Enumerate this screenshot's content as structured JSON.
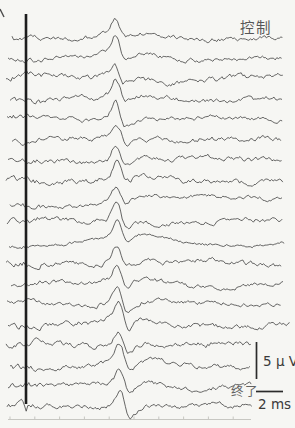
{
  "figure": {
    "bg_color": "#f6f6f3",
    "trace_color": "#343434",
    "labels": {
      "control": "控制",
      "end": "终了",
      "voltage_scale": "5 μ V",
      "time_scale": "2 ms"
    }
  },
  "chart_data": {
    "type": "line",
    "x_unit": "ms",
    "y_unit": "uV",
    "px_per_ms": 13.2,
    "px_per_uv": 7.2,
    "stimulus_onset_px": 26,
    "peak_latency_ms_approx": 6.9,
    "peak_amplitude_uv_approx": 2.5,
    "num_traces": 19,
    "legend": {
      "top_trace_condition": "控制",
      "bottom_trace_condition": "终了"
    },
    "stimulus_bar": {
      "x": 26,
      "width": 2.6,
      "y1": 14,
      "y2": 404,
      "color": "#1d1d1d"
    },
    "scalebars": {
      "vertical": {
        "x": 256.5,
        "y1": 342,
        "y2": 379,
        "value_uv": 5
      },
      "horizontal": {
        "x1": 256,
        "x2": 283,
        "y": 391.5,
        "value_ms": 2
      }
    },
    "axis": {
      "x1": 8,
      "x2": 251,
      "y": 419.5,
      "tick_start": 10,
      "tick_spacing": 24.8,
      "tick_count": 10,
      "tick_len": 3,
      "color": "#c7c7c2"
    },
    "traces": [
      {
        "baseline": 37.5,
        "peak_x": 115,
        "peak_h": 17,
        "start_x": 12,
        "end_x": 283,
        "noise": 1.7,
        "drift_amp": 2.0,
        "drift_period": 190,
        "drift_phase": 0.8,
        "under": 4,
        "pre": 3,
        "slow": 2,
        "artifact": 0,
        "seed": 7
      },
      {
        "baseline": 58.0,
        "peak_x": 116,
        "peak_h": 19,
        "start_x": 8,
        "end_x": 282,
        "noise": 1.6,
        "drift_amp": 2.5,
        "drift_period": 230,
        "drift_phase": 2.1,
        "under": 6,
        "pre": 2,
        "slow": 3,
        "artifact": 0,
        "seed": 23
      },
      {
        "baseline": 78.5,
        "peak_x": 115,
        "peak_h": 15,
        "start_x": 6,
        "end_x": 284,
        "noise": 1.9,
        "drift_amp": 4.0,
        "drift_period": 240,
        "drift_phase": 3.6,
        "under": 3,
        "pre": 4,
        "slow": 1,
        "artifact": 0,
        "seed": 41
      },
      {
        "baseline": 99.0,
        "peak_x": 116,
        "peak_h": 17,
        "start_x": 10,
        "end_x": 282,
        "noise": 1.8,
        "drift_amp": 2.0,
        "drift_period": 200,
        "drift_phase": 1.2,
        "under": 5,
        "pre": 2,
        "slow": 2,
        "artifact": 0,
        "seed": 59
      },
      {
        "baseline": 119.5,
        "peak_x": 116,
        "peak_h": 20,
        "start_x": 7,
        "end_x": 283,
        "noise": 1.6,
        "drift_amp": 2.5,
        "drift_period": 210,
        "drift_phase": 4.4,
        "under": 7,
        "pre": 3,
        "slow": 3,
        "artifact": 0,
        "seed": 77
      },
      {
        "baseline": 140.0,
        "peak_x": 117,
        "peak_h": 16,
        "start_x": 12,
        "end_x": 281,
        "noise": 1.8,
        "drift_amp": 2.0,
        "drift_period": 180,
        "drift_phase": 2.8,
        "under": 4,
        "pre": 3,
        "slow": 2,
        "artifact": 0,
        "seed": 95
      },
      {
        "baseline": 160.5,
        "peak_x": 116,
        "peak_h": 18,
        "start_x": 8,
        "end_x": 283,
        "noise": 1.7,
        "drift_amp": 2.5,
        "drift_period": 220,
        "drift_phase": 5.2,
        "under": 6,
        "pre": 2,
        "slow": 2,
        "artifact": 0,
        "seed": 113
      },
      {
        "baseline": 181.0,
        "peak_x": 117,
        "peak_h": 17,
        "start_x": 6,
        "end_x": 284,
        "noise": 1.9,
        "drift_amp": 2.0,
        "drift_period": 200,
        "drift_phase": 0.5,
        "under": 5,
        "pre": 4,
        "slow": 3,
        "artifact": 0,
        "seed": 131
      },
      {
        "baseline": 201.5,
        "peak_x": 116,
        "peak_h": 15,
        "start_x": 10,
        "end_x": 282,
        "noise": 1.5,
        "drift_amp": 5.0,
        "drift_period": 330,
        "drift_phase": 0.7,
        "under": 4,
        "pre": 2,
        "slow": 6,
        "artifact": 0,
        "seed": 149
      },
      {
        "baseline": 222.0,
        "peak_x": 117,
        "peak_h": 21,
        "start_x": 7,
        "end_x": 283,
        "noise": 1.6,
        "drift_amp": 2.5,
        "drift_period": 210,
        "drift_phase": 3.3,
        "under": 8,
        "pre": 3,
        "slow": 2,
        "artifact": 0,
        "seed": 167
      },
      {
        "baseline": 242.5,
        "peak_x": 118,
        "peak_h": 18,
        "start_x": 9,
        "end_x": 285,
        "noise": 0.9,
        "drift_amp": 4.0,
        "drift_period": 210,
        "drift_phase": 1.1,
        "under": 6,
        "pre": 2,
        "slow": 5,
        "artifact": 0,
        "seed": 185
      },
      {
        "baseline": 263.0,
        "peak_x": 117,
        "peak_h": 16,
        "start_x": 6,
        "end_x": 282,
        "noise": 1.8,
        "drift_amp": 2.0,
        "drift_period": 190,
        "drift_phase": 4.8,
        "under": 5,
        "pre": 3,
        "slow": 2,
        "artifact": 0,
        "seed": 203
      },
      {
        "baseline": 283.5,
        "peak_x": 118,
        "peak_h": 17,
        "start_x": 11,
        "end_x": 283,
        "noise": 1.7,
        "drift_amp": 2.5,
        "drift_period": 230,
        "drift_phase": 2.2,
        "under": 6,
        "pre": 2,
        "slow": 3,
        "artifact": 0,
        "seed": 221
      },
      {
        "baseline": 304.0,
        "peak_x": 118,
        "peak_h": 20,
        "start_x": 7,
        "end_x": 282,
        "noise": 1.6,
        "drift_amp": 2.0,
        "drift_period": 200,
        "drift_phase": 5.6,
        "under": 9,
        "pre": 3,
        "slow": 2,
        "artifact": 0,
        "seed": 239
      },
      {
        "baseline": 324.5,
        "peak_x": 119,
        "peak_h": 21,
        "start_x": 8,
        "end_x": 290,
        "noise": 1.8,
        "drift_amp": 2.5,
        "drift_period": 210,
        "drift_phase": 1.5,
        "under": 10,
        "pre": 4,
        "slow": 3,
        "artifact": 0,
        "seed": 257
      },
      {
        "baseline": 345.0,
        "peak_x": 119,
        "peak_h": 17,
        "start_x": 6,
        "end_x": 252,
        "noise": 1.9,
        "drift_amp": 2.0,
        "drift_period": 190,
        "drift_phase": 3.9,
        "under": 7,
        "pre": 2,
        "slow": 2,
        "artifact": 0,
        "seed": 275
      },
      {
        "baseline": 365.5,
        "peak_x": 120,
        "peak_h": 18,
        "start_x": 10,
        "end_x": 250,
        "noise": 1.7,
        "drift_amp": 3.0,
        "drift_period": 200,
        "drift_phase": 0.3,
        "under": 8,
        "pre": 3,
        "slow": 2,
        "artifact": 0,
        "seed": 293
      },
      {
        "baseline": 386.0,
        "peak_x": 120,
        "peak_h": 16,
        "start_x": 8,
        "end_x": 252,
        "noise": 1.8,
        "drift_amp": 2.5,
        "drift_period": 210,
        "drift_phase": 2.6,
        "under": 7,
        "pre": 2,
        "slow": 3,
        "artifact": 0,
        "seed": 311
      },
      {
        "baseline": 406.5,
        "peak_x": 121,
        "peak_h": 20,
        "start_x": 7,
        "end_x": 252,
        "noise": 1.7,
        "drift_amp": 2.0,
        "drift_period": 220,
        "drift_phase": 4.1,
        "under": 12,
        "pre": 3,
        "slow": 2,
        "artifact": 8,
        "seed": 329
      }
    ]
  }
}
